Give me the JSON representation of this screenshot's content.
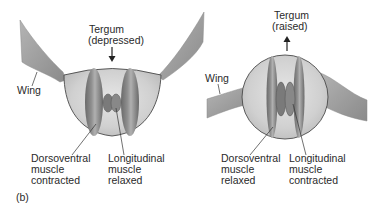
{
  "figure_label": "(b)",
  "panels": [
    {
      "id": "downstroke",
      "tergum": {
        "title": "Tergum",
        "state": "(depressed)",
        "arrow": "down"
      },
      "wing_label": "Wing",
      "left_label": {
        "line1": "Dorsoventral",
        "line2": "muscle",
        "line3": "contracted"
      },
      "right_label": {
        "line1": "Longitudinal",
        "line2": "muscle",
        "line3": "relaxed"
      }
    },
    {
      "id": "upstroke",
      "tergum": {
        "title": "Tergum",
        "state": "(raised)",
        "arrow": "up"
      },
      "wing_label": "Wing",
      "left_label": {
        "line1": "Dorsoventral",
        "line2": "muscle",
        "line3": "relaxed"
      },
      "right_label": {
        "line1": "Longitudinal",
        "line2": "muscle",
        "line3": "contracted"
      }
    }
  ],
  "colors": {
    "background": "#ffffff",
    "text": "#2a2a2a",
    "wing": "#9a9a9a",
    "thorax_fill": "#d4d4d4",
    "thorax_outline": "#555555",
    "muscle_dark": "#6e6e6e",
    "muscle_mid": "#8c8c8c",
    "muscle_light": "#b5b5b5"
  }
}
